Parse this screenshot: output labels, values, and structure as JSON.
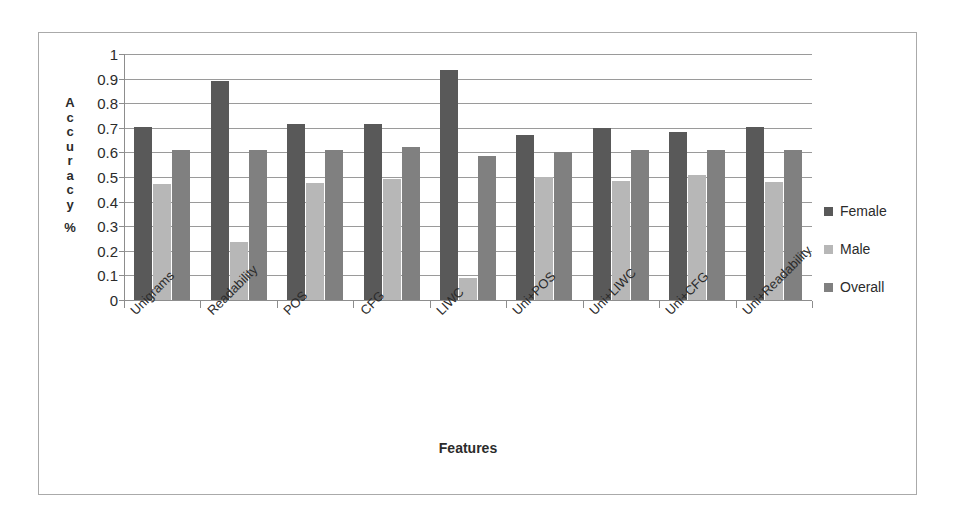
{
  "chart_data": {
    "type": "bar",
    "title": "",
    "subtitle": "",
    "xlabel": "Features",
    "ylabel": "Accuracy %",
    "ylim": [
      0,
      1
    ],
    "ytick_values": [
      0,
      0.1,
      0.2,
      0.3,
      0.4,
      0.5,
      0.6,
      0.7,
      0.8,
      0.9,
      1
    ],
    "ytick_labels": [
      "0",
      "0.1",
      "0.2",
      "0.3",
      "0.4",
      "0.5",
      "0.6",
      "0.7",
      "0.8",
      "0.9",
      "1"
    ],
    "grid": true,
    "grid_axis": "y",
    "legend_position": "right",
    "categories": [
      "Unigrams",
      "Readability",
      "POS",
      "CFG",
      "LIWC",
      "Uni+POS",
      "Uni+LIWC",
      "Uni+CFG",
      "Uni+Readability"
    ],
    "series": [
      {
        "name": "Female",
        "color": "#595959",
        "values": [
          0.705,
          0.89,
          0.715,
          0.715,
          0.935,
          0.67,
          0.7,
          0.685,
          0.705
        ]
      },
      {
        "name": "Male",
        "color": "#b7b7b7",
        "values": [
          0.47,
          0.235,
          0.475,
          0.49,
          0.09,
          0.5,
          0.485,
          0.51,
          0.48
        ]
      },
      {
        "name": "Overall",
        "color": "#808080",
        "values": [
          0.61,
          0.61,
          0.61,
          0.62,
          0.585,
          0.6,
          0.61,
          0.61,
          0.61
        ]
      }
    ]
  },
  "axis": {
    "y_title_letters": [
      "A",
      "c",
      "c",
      "u",
      "r",
      "a",
      "c",
      "y"
    ],
    "y_title_suffix": "%",
    "x_title": "Features"
  },
  "legend": {
    "items": [
      {
        "label": "Female",
        "color": "#595959"
      },
      {
        "label": "Male",
        "color": "#b7b7b7"
      },
      {
        "label": "Overall",
        "color": "#808080"
      }
    ]
  },
  "colors": {
    "frame": "#aaaaaa",
    "gridline": "#9a9a9a",
    "axis": "#8d8d8d",
    "text": "#2b2b2b",
    "background": "#ffffff"
  }
}
